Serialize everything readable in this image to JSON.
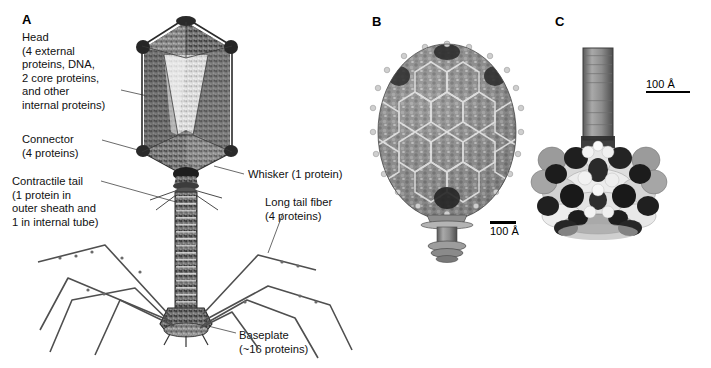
{
  "figure": {
    "background_color": "#ffffff",
    "width": 711,
    "height": 368
  },
  "panels": [
    {
      "letter": "A",
      "title": "Schematic drawing of bacteriophage T4 with labeled parts",
      "callouts": [
        {
          "name": "head",
          "text": "Head\n(4 external\nproteins, DNA,\n2 core proteins,\nand other\ninternal proteins)"
        },
        {
          "name": "connector",
          "text": "Connector\n(4 proteins)"
        },
        {
          "name": "contractile-tail",
          "text": "Contractile tail\n(1 protein in\nouter sheath and\n1 in internal tube)"
        },
        {
          "name": "whisker",
          "text": "Whisker (1 protein)"
        },
        {
          "name": "long-tail-fiber",
          "text": "Long tail fiber\n(4 proteins)"
        },
        {
          "name": "baseplate",
          "text": "Baseplate\n(~16 proteins)"
        }
      ]
    },
    {
      "letter": "B",
      "title": "Reconstruction of phage capsid with hexagonal capsomere lattice",
      "scalebar": {
        "label": "100 Å",
        "position": "right-of-neck"
      }
    },
    {
      "letter": "C",
      "title": "Baseplate and tail tube structure with numbered gene products",
      "scalebar": {
        "label": "100 Å",
        "position": "upper-right"
      },
      "numbered_parts": [
        {
          "name": "tail-tube-gp19",
          "label": "19"
        },
        {
          "name": "baseplate-gp6",
          "label": "6"
        },
        {
          "name": "baseplate-gp10",
          "label": "10"
        },
        {
          "name": "baseplate-gp11",
          "label": "11"
        }
      ]
    }
  ],
  "colors": {
    "ink": "#111111",
    "leader_line": "#333333",
    "capsid_dark": "#4a4a4a",
    "capsid_mid": "#7d7d7d",
    "capsid_light": "#c9c9c9",
    "scale_bar": "#000000"
  }
}
